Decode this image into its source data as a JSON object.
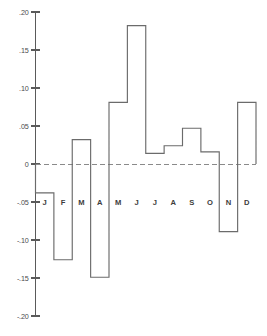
{
  "chart_data": {
    "type": "bar",
    "title": "",
    "subtitle": "",
    "xlabel": "",
    "ylabel": "",
    "categories": [
      "J",
      "F",
      "M",
      "A",
      "M",
      "J",
      "J",
      "A",
      "S",
      "O",
      "N",
      "D"
    ],
    "category_names": [
      "January",
      "February",
      "March",
      "April",
      "May",
      "June",
      "July",
      "August",
      "September",
      "October",
      "November",
      "December"
    ],
    "values": [
      -0.038,
      -0.126,
      0.032,
      -0.149,
      0.081,
      0.182,
      0.014,
      0.024,
      0.047,
      0.016,
      -0.089,
      0.081
    ],
    "ylim": [
      -0.2,
      0.2
    ],
    "ytick_values": [
      0.2,
      0.15,
      0.1,
      0.05,
      0,
      -0.05,
      -0.1,
      -0.15,
      -0.2
    ],
    "ytick_labels": [
      ".20",
      ".15",
      ".10",
      ".05",
      "0",
      "-.05",
      "-.10",
      "-.15",
      "-.20"
    ],
    "grid": false,
    "zero_line": true,
    "zero_line_style": "dashed",
    "legend": null,
    "style": "step-outline-bars",
    "colors": {
      "axis": "#5a5a5a",
      "bars": "#6b6b6b",
      "zero_line": "#8a8a8a",
      "text": "#3d3d3d",
      "background": "#ffffff"
    }
  }
}
